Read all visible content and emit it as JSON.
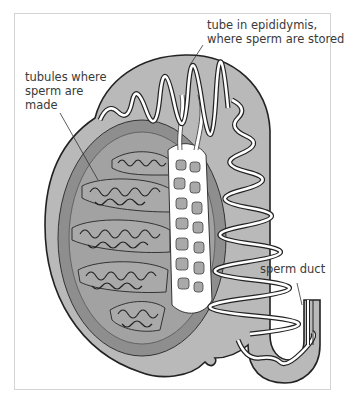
{
  "diagram": {
    "labels": {
      "epididymis_tube": "tube in epididymis,\nwhere sperm are stored",
      "tubules": "tubules where\nsperm are\nmade",
      "sperm_duct": "sperm duct"
    },
    "colors": {
      "outer_layer": "#b9b9b9",
      "inner_ring": "#8e8e8e",
      "lobule": "#a9a9a9",
      "network": "#ffffff",
      "outline": "#222222",
      "frame": "#d4d4d4"
    }
  }
}
